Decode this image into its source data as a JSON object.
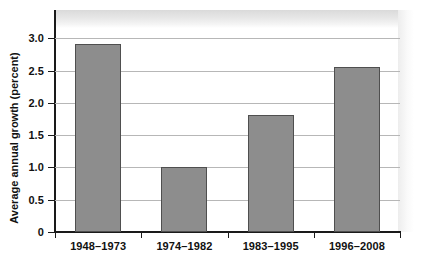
{
  "chart_data": {
    "type": "bar",
    "title": "",
    "xlabel": "",
    "ylabel": "Average annual growth (percent)",
    "categories": [
      "1948–1973",
      "1974–1982",
      "1983–1995",
      "1996–2008"
    ],
    "values": [
      2.92,
      1.0,
      1.82,
      2.55
    ],
    "ylim": [
      0,
      3.1
    ],
    "yticks": [
      "0",
      "0.5",
      "1.0",
      "1.5",
      "2.0",
      "2.5",
      "3.0"
    ],
    "ytick_values": [
      0,
      0.5,
      1.0,
      1.5,
      2.0,
      2.5,
      3.0
    ],
    "grid": true,
    "legend": "none",
    "colors": {
      "bar_fill": "#8d8d8d",
      "bar_stroke": "#4f4f4f",
      "gridline": "#b7b7b7",
      "axis": "#1a1a1a",
      "text": "#111111",
      "background": "#ffffff"
    }
  }
}
